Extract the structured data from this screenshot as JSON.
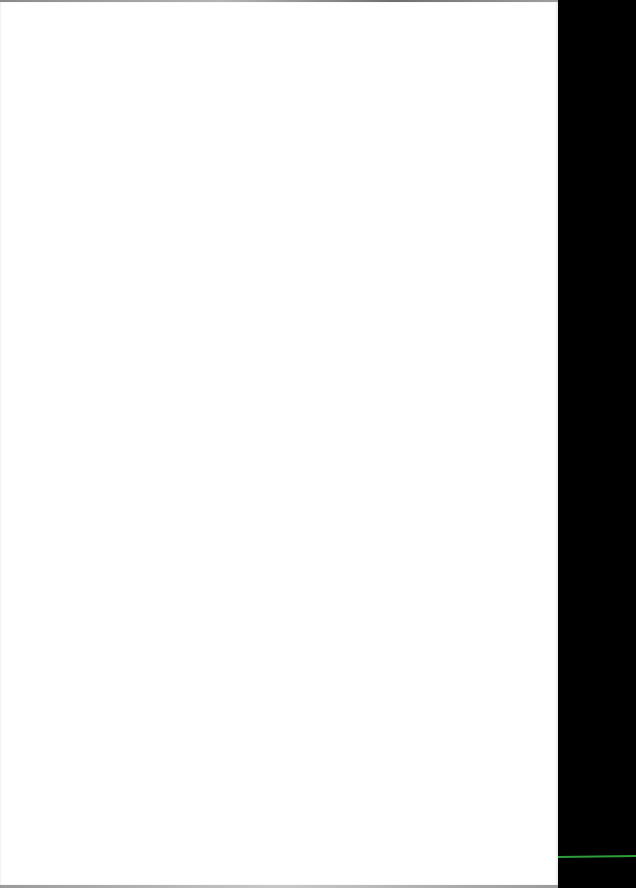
{
  "scene": {
    "description": "Blank white sheet against dark background",
    "sheet_color": "#ffffff",
    "background_color": "#000000",
    "accent_line_color": "#2e9e3a"
  }
}
